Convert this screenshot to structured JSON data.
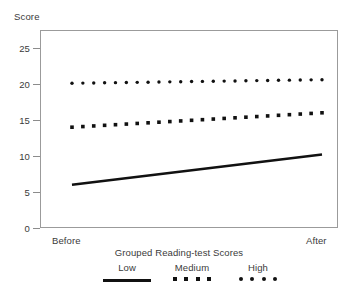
{
  "chart_data": {
    "type": "line",
    "title": "",
    "xlabel": "",
    "ylabel": "Score",
    "legend_title": "Grouped Reading-test Scores",
    "legend_position": "bottom-center",
    "grid": false,
    "x": [
      "Before",
      "After"
    ],
    "xtick_labels": [
      "Before",
      "After"
    ],
    "ytick_labels": [
      "0",
      "5",
      "10",
      "15",
      "20",
      "25"
    ],
    "yticks": [
      0,
      5,
      10,
      15,
      20,
      25
    ],
    "ylim": [
      0,
      27.5
    ],
    "series": [
      {
        "name": "Low",
        "marker": "solid-line",
        "values": [
          6.0,
          10.2
        ],
        "color": "#111111"
      },
      {
        "name": "Medium",
        "marker": "square",
        "values": [
          14.0,
          16.0
        ],
        "color": "#111111"
      },
      {
        "name": "High",
        "marker": "circle",
        "values": [
          20.1,
          20.6
        ],
        "color": "#111111"
      }
    ],
    "n_markers": 24,
    "axis_color": "#9b9b9b",
    "text_color": "#3a3a3a"
  },
  "axes": {
    "y_title": "Score",
    "x_before": "Before",
    "x_after": "After"
  },
  "legend": {
    "title": "Grouped Reading-test Scores",
    "items": [
      {
        "label": "Low"
      },
      {
        "label": "Medium"
      },
      {
        "label": "High"
      }
    ]
  }
}
